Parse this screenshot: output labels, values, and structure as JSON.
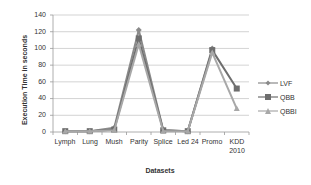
{
  "chart_data": {
    "type": "line",
    "title": "",
    "xlabel": "Datasets",
    "ylabel": "Execution Time in seconds",
    "ylim": [
      0,
      140
    ],
    "yticks": [
      0,
      20,
      40,
      60,
      80,
      100,
      120,
      140
    ],
    "grid": true,
    "legend_position": "right",
    "categories": [
      "Lymph",
      "Lung",
      "Mush",
      "Parity",
      "Splice",
      "Led 24",
      "Promo",
      "KDD 2010"
    ],
    "series": [
      {
        "name": "LVF",
        "marker": "diamond",
        "color": "#8a8a8a",
        "values": [
          1,
          1,
          5,
          122,
          2,
          1,
          100,
          null
        ]
      },
      {
        "name": "QBB",
        "marker": "square",
        "color": "#6e6e6e",
        "values": [
          1,
          1,
          3,
          112,
          2,
          1,
          98,
          52
        ]
      },
      {
        "name": "QBBI",
        "marker": "triangle",
        "color": "#a8a8a8",
        "values": [
          1,
          1,
          2,
          105,
          1,
          1,
          95,
          28
        ]
      }
    ]
  },
  "axis": {
    "ytitle": "Execution Time in seconds",
    "xtitle": "Datasets",
    "yticks": [
      "140",
      "120",
      "100",
      "80",
      "60",
      "40",
      "20",
      "0"
    ],
    "xticks": [
      {
        "l1": "Lymph",
        "l2": ""
      },
      {
        "l1": "Lung",
        "l2": ""
      },
      {
        "l1": "Mush",
        "l2": ""
      },
      {
        "l1": "Parity",
        "l2": ""
      },
      {
        "l1": "Splice",
        "l2": ""
      },
      {
        "l1": "Led 24",
        "l2": ""
      },
      {
        "l1": "Promo",
        "l2": ""
      },
      {
        "l1": "KDD",
        "l2": "2010"
      }
    ]
  },
  "legend": {
    "items": [
      {
        "label": "LVF"
      },
      {
        "label": "QBB"
      },
      {
        "label": "QBBI"
      }
    ]
  }
}
